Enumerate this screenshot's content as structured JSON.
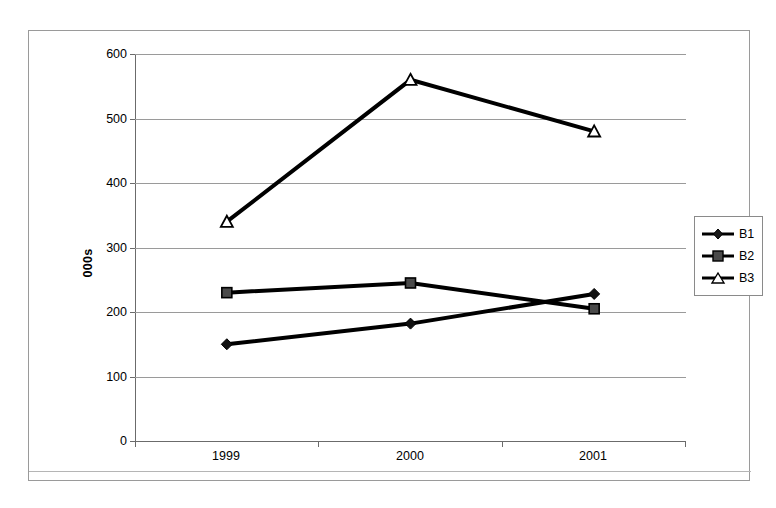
{
  "chart_data": {
    "type": "line",
    "title": "",
    "xlabel": "",
    "ylabel": "000s",
    "categories": [
      "1999",
      "2000",
      "2001"
    ],
    "series": [
      {
        "name": "B1",
        "values": [
          150,
          182,
          228
        ],
        "marker": "filled-diamond",
        "color": "#000000"
      },
      {
        "name": "B2",
        "values": [
          230,
          245,
          205
        ],
        "marker": "filled-square",
        "color": "#000000"
      },
      {
        "name": "B3",
        "values": [
          340,
          560,
          480
        ],
        "marker": "open-triangle",
        "color": "#000000"
      }
    ],
    "ylim": [
      0,
      600
    ],
    "y_ticks": [
      0,
      100,
      200,
      300,
      400,
      500,
      600
    ],
    "y_tick_labels": [
      "0",
      "100",
      "200",
      "300",
      "400",
      "500",
      "600"
    ],
    "grid": true,
    "legend_position": "right",
    "legend_entries": [
      "B1",
      "B2",
      "B3"
    ],
    "colors": {
      "series": "#000000",
      "gridline": "#9a9a9a",
      "axis": "#6b6b6b",
      "frame": "#9a9a9a",
      "background": "#ffffff"
    }
  },
  "axes": {
    "y_ticks": [
      {
        "label": "600",
        "value": 600
      },
      {
        "label": "500",
        "value": 500
      },
      {
        "label": "400",
        "value": 400
      },
      {
        "label": "300",
        "value": 300
      },
      {
        "label": "200",
        "value": 200
      },
      {
        "label": "100",
        "value": 100
      },
      {
        "label": "0",
        "value": 0
      }
    ],
    "y_title": "000s",
    "x_ticks": [
      {
        "label": "1999"
      },
      {
        "label": "2000"
      },
      {
        "label": "2001"
      }
    ]
  },
  "legend": {
    "items": [
      {
        "label": "B1"
      },
      {
        "label": "B2"
      },
      {
        "label": "B3"
      }
    ]
  }
}
